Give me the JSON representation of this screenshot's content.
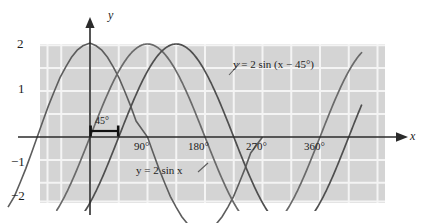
{
  "figure": {
    "title_text": "",
    "background_color": "#ffffff",
    "panel_color": "#d4d4d4",
    "grid_color": "#f2f2f2",
    "curve_color": "#595959",
    "axis_color": "#2b2b2b"
  },
  "axes": {
    "x_axis_label": "x",
    "y_axis_label": "y",
    "x_ticks": [
      {
        "label": "90°",
        "value": 90
      },
      {
        "label": "180°",
        "value": 180
      },
      {
        "label": "270°",
        "value": 270
      },
      {
        "label": "360°",
        "value": 360
      }
    ],
    "y_ticks": [
      {
        "label": "2",
        "value": 2
      },
      {
        "label": "1",
        "value": 1
      },
      {
        "label": "−1",
        "value": -1
      },
      {
        "label": "−2",
        "value": -2
      }
    ]
  },
  "annotations": {
    "phase_bracket_label": "45°",
    "curve_label_shifted": "y = 2 sin (x − 45°)",
    "curve_label_base": "y = 2 sin x"
  },
  "chart_data": {
    "type": "line",
    "title": "",
    "xlabel": "x",
    "ylabel": "y",
    "xlim": [
      -50,
      420
    ],
    "ylim": [
      -2.55,
      2.55
    ],
    "x_unit": "degrees",
    "grid": true,
    "grid_x_step": 45,
    "grid_y_step": 0.5,
    "legend": "inline-annotations",
    "x_ticks": [
      90,
      180,
      270,
      360
    ],
    "x_tick_labels": [
      "90°",
      "180°",
      "270°",
      "360°"
    ],
    "y_ticks": [
      2,
      1,
      -1,
      -2
    ],
    "y_tick_labels": [
      "2",
      "1",
      "−1",
      "−2"
    ],
    "annotations": [
      {
        "text": "45°",
        "x": 22.5,
        "y": 0.28,
        "kind": "phase-shift-bracket",
        "span": [
          0,
          45
        ]
      },
      {
        "text": "y = 2 sin (x − 45°)",
        "x": 208,
        "y": 1.32,
        "kind": "curve-label"
      },
      {
        "text": "y = 2 sin x",
        "x": 112,
        "y": -0.78,
        "kind": "curve-label"
      }
    ],
    "series": [
      {
        "name": "y = 2 sin x",
        "amplitude": 2,
        "phase_deg": 0,
        "period_deg": 360,
        "x": [
          -50,
          -40,
          -30,
          -20,
          -10,
          0,
          10,
          20,
          30,
          40,
          50,
          60,
          70,
          80,
          90,
          100,
          110,
          120,
          130,
          140,
          150,
          160,
          170,
          180,
          190,
          200,
          210,
          220,
          230,
          240,
          250,
          260,
          270,
          280,
          290,
          300,
          310,
          320,
          330,
          340,
          350,
          360,
          370,
          380,
          390,
          400,
          410,
          420
        ],
        "values": [
          -1.53,
          -1.29,
          -1.0,
          -0.68,
          -0.35,
          0.0,
          0.35,
          0.68,
          1.0,
          1.29,
          1.53,
          1.73,
          1.88,
          1.97,
          2.0,
          1.97,
          1.88,
          1.73,
          1.53,
          1.29,
          1.0,
          0.68,
          0.35,
          0.0,
          -0.35,
          -0.68,
          -1.0,
          -1.29,
          -1.53,
          -1.73,
          -1.88,
          -1.97,
          -2.0,
          -1.97,
          -1.88,
          -1.73,
          -1.53,
          -1.29,
          -1.0,
          -0.68,
          -0.35,
          0.0,
          0.35,
          0.68,
          1.0,
          1.29,
          1.53,
          1.73
        ]
      },
      {
        "name": "y = 2 sin (x − 45°)",
        "amplitude": 2,
        "phase_deg": 45,
        "period_deg": 360,
        "x": [
          -50,
          -40,
          -30,
          -20,
          -10,
          0,
          10,
          20,
          30,
          40,
          50,
          60,
          70,
          80,
          90,
          100,
          110,
          120,
          130,
          140,
          150,
          160,
          170,
          180,
          190,
          200,
          210,
          220,
          230,
          240,
          250,
          260,
          270,
          280,
          290,
          300,
          310,
          320,
          330,
          340,
          350,
          360,
          370,
          380,
          390,
          400,
          410,
          420
        ],
        "values": [
          -1.97,
          -2.0,
          -1.97,
          -1.88,
          -1.73,
          -1.41,
          -1.19,
          -0.91,
          -0.61,
          -0.35,
          -0.09,
          0.35,
          0.68,
          1.0,
          1.41,
          1.62,
          1.81,
          1.93,
          2.0,
          1.97,
          1.88,
          1.73,
          1.53,
          1.41,
          1.0,
          0.68,
          0.35,
          0.0,
          -0.35,
          -0.68,
          -1.0,
          -1.29,
          -1.41,
          -1.81,
          -1.93,
          -2.0,
          -1.97,
          -1.88,
          -1.73,
          -1.53,
          -1.29,
          -1.41,
          -0.68,
          -0.35,
          0.0,
          0.35,
          0.68,
          1.0
        ]
      }
    ]
  }
}
